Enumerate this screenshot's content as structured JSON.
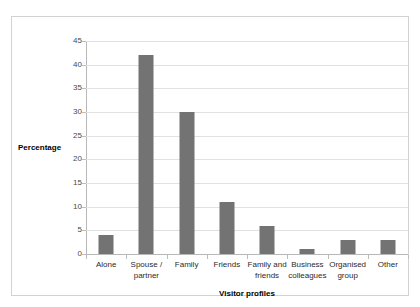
{
  "title_remnant": "Figure: Visitor profiles by group",
  "chart_data": {
    "type": "bar",
    "title": "",
    "xlabel": "Visitor profiles",
    "ylabel": "Percentage",
    "categories": [
      "Alone",
      "Spouse / partner",
      "Family",
      "Friends",
      "Family and friends",
      "Business colleagues",
      "Organised group",
      "Other"
    ],
    "values": [
      4,
      42,
      30,
      11,
      6,
      1,
      3,
      3
    ],
    "ylim": [
      0,
      45
    ],
    "ytick_values": [
      0,
      5,
      10,
      15,
      20,
      25,
      30,
      35,
      40,
      45
    ],
    "ytick_labels": [
      "0",
      "5",
      "10",
      "15",
      "20",
      "25",
      "30",
      "35",
      "40",
      "45"
    ],
    "grid": true,
    "legend": false,
    "bar_color": "#737373",
    "gridline_color": "#e2e2e2",
    "axis_color": "#b8b8b8",
    "frame_color": "#d2d2d2"
  }
}
